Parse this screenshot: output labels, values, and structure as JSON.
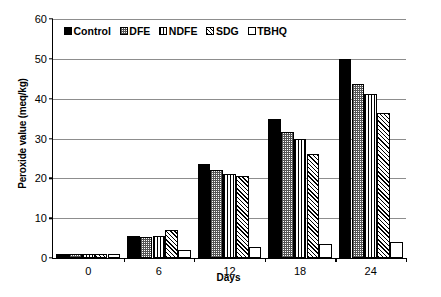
{
  "chart_data": {
    "type": "bar",
    "title": "",
    "xlabel": "Days",
    "ylabel": "Peroxide value (meq/kg)",
    "categories": [
      "0",
      "6",
      "12",
      "18",
      "24"
    ],
    "ylim": [
      0,
      60
    ],
    "yticks": [
      0,
      10,
      20,
      30,
      40,
      50,
      60
    ],
    "grid": true,
    "legend_position": "top-left inside plot",
    "series": [
      {
        "name": "Control",
        "pattern": "solid",
        "values": [
          1.0,
          5.6,
          23.6,
          34.8,
          49.9
        ]
      },
      {
        "name": "DFE",
        "pattern": "dots",
        "values": [
          1.0,
          5.4,
          22.0,
          31.6,
          43.8
        ]
      },
      {
        "name": "NDFE",
        "pattern": "vlines",
        "values": [
          1.0,
          5.6,
          21.2,
          30.0,
          41.3
        ]
      },
      {
        "name": "SDG",
        "pattern": "hatch",
        "values": [
          1.0,
          7.0,
          20.7,
          26.2,
          36.3
        ]
      },
      {
        "name": "TBHQ",
        "pattern": "empty",
        "values": [
          1.0,
          2.1,
          2.7,
          3.6,
          3.9
        ]
      }
    ]
  },
  "axes": {
    "y_tick_labels": [
      "0",
      "10",
      "20",
      "30",
      "40",
      "50",
      "60"
    ],
    "x_tick_labels": [
      "0",
      "6",
      "12",
      "18",
      "24"
    ],
    "y_title": "Peroxide value (meq/kg)",
    "x_title": "Days"
  },
  "legend": {
    "items": [
      {
        "label": "Control",
        "pattern": "solid"
      },
      {
        "label": "DFE",
        "pattern": "dots"
      },
      {
        "label": "NDFE",
        "pattern": "vlines"
      },
      {
        "label": "SDG",
        "pattern": "hatch"
      },
      {
        "label": "TBHQ",
        "pattern": "empty"
      }
    ]
  },
  "colors": {
    "axis": "#000000",
    "gridline": "#8d8d8d",
    "background": "#ffffff",
    "series_fill": "#000000"
  }
}
